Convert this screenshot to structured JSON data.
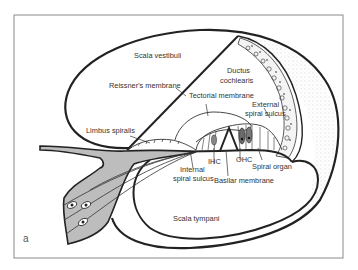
{
  "figure": {
    "panel_letter": "a",
    "frame_color": "#8a8a8a",
    "line_color": "#222222",
    "ganglion_fill": "#bdbdbd",
    "stipple_color": "#9a9a9a"
  },
  "labels": {
    "scala_vestibuli": "Scala vestibuli",
    "reissners_membrane": "Reissner's membrane",
    "ductus_cochlearis_1": "Ductus",
    "ductus_cochlearis_2": "cochlearis",
    "tectorial_membrane": "Tectorial membrane",
    "external_spiral_sulcus_1": "External",
    "external_spiral_sulcus_2": "spiral sulcus",
    "limbus_spiralis": "Limbus spiralis",
    "internal_spiral_sulcus_1": "Internal",
    "internal_spiral_sulcus_2": "spiral sulcus",
    "ihc": "IHC",
    "ohc": "OHC",
    "spiral_organ": "Spiral organ",
    "basilar_membrane": "Basilar membrane",
    "scala_tympani": "Scala tympani"
  }
}
